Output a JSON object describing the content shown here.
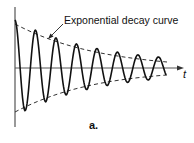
{
  "figure": {
    "annotation": "Exponential decay curve",
    "axis_label_x": "t",
    "panel_label": "a."
  },
  "chart_data": {
    "type": "line",
    "title": "",
    "xlabel": "t",
    "ylabel": "",
    "series": [
      {
        "name": "Damped oscillation",
        "style": "solid"
      },
      {
        "name": "Exponential decay curve (upper envelope)",
        "style": "dashed"
      },
      {
        "name": "Exponential decay curve (lower envelope)",
        "style": "dashed"
      }
    ],
    "annotations": [
      "Exponential decay curve",
      "a."
    ],
    "grid": false,
    "legend": "none"
  },
  "colors": {
    "stroke": "#111111",
    "axis": "#444444",
    "background": "#ffffff"
  }
}
